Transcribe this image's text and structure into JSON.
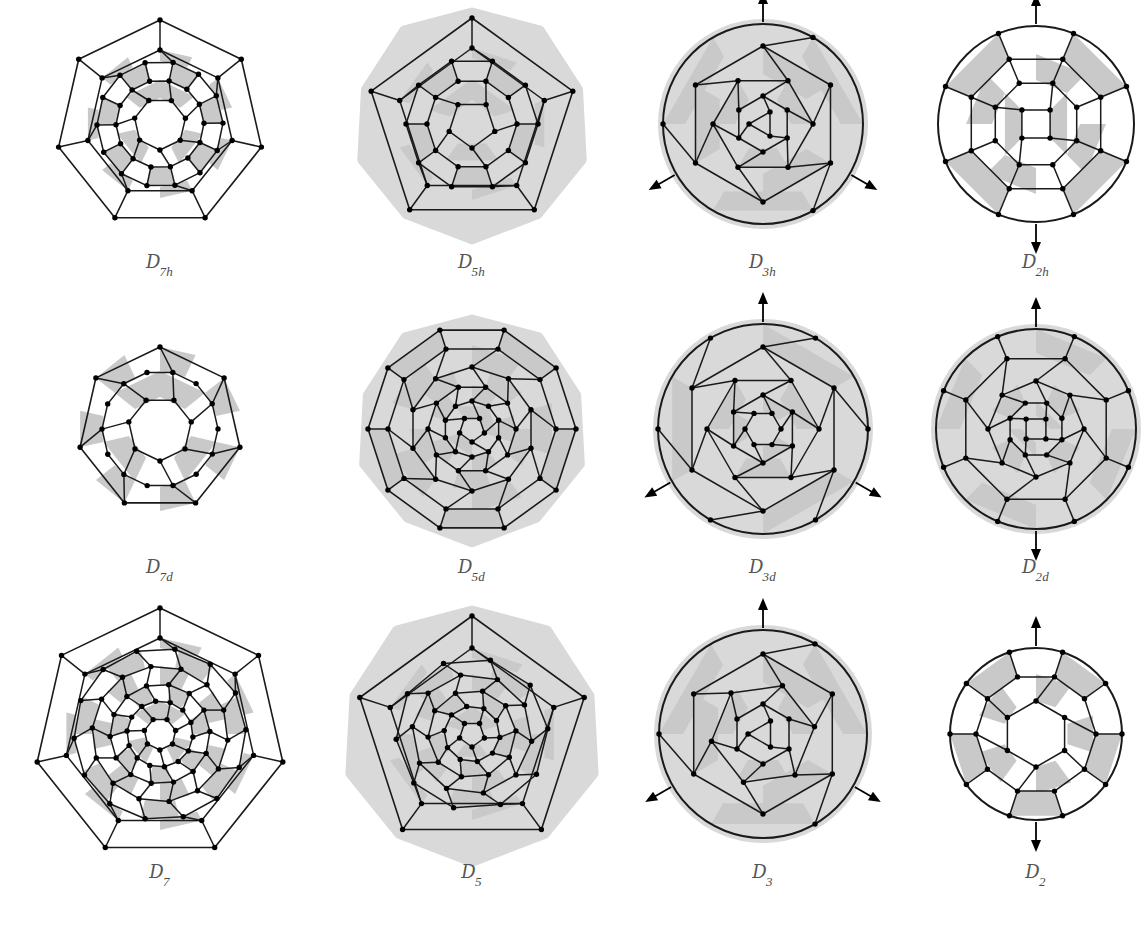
{
  "figure": {
    "kind": "fullerene-schlegel-diagram-grid",
    "rows": 3,
    "columns": 4,
    "background_color": "#ffffff",
    "face_fill_gray": "#c9c9c9",
    "face_fill_white": "#ffffff",
    "halo_color": "#d9d9d9",
    "edge_color": "#1a1a1a",
    "vertex_color": "#000000",
    "label_color": "#4a4a4a"
  },
  "caption": {
    "text": ""
  },
  "panels": [
    {
      "id": "d7h",
      "label_symbol": "D",
      "label_sub": "7h",
      "order": 7,
      "has_halo": false,
      "halo_shape": "none",
      "arrows": 0,
      "arrow_style": "none",
      "outer_polygon_sides": 7,
      "radius": 104,
      "rings": [
        {
          "n": 7,
          "r": 104,
          "shape": "polygon",
          "spoke_to_next": true,
          "rotate": 0
        },
        {
          "n": 7,
          "r": 74,
          "shape": "polygon",
          "spoke_to_next": true,
          "rotate": 0
        },
        {
          "n": 14,
          "r": 63,
          "shape": "polygon",
          "spoke_to_next": true,
          "rotate": 12
        },
        {
          "n": 14,
          "r": 44,
          "shape": "polygon",
          "spoke_to_next": true,
          "rotate": 12
        },
        {
          "n": 7,
          "r": 26,
          "shape": "polygon",
          "spoke_to_next": true,
          "rotate": 26
        }
      ],
      "gray_bands": [
        {
          "r_outer": 74,
          "r_inner": 63,
          "segments": 14,
          "phase": 0
        },
        {
          "r_outer": 63,
          "r_inner": 44,
          "segments": 14,
          "phase": 0.5
        },
        {
          "r_outer": 44,
          "r_inner": 26,
          "segments": 7,
          "phase": 0
        }
      ]
    },
    {
      "id": "d5h",
      "label_symbol": "D",
      "label_sub": "5h",
      "order": 5,
      "has_halo": true,
      "halo_shape": "round-pentagon",
      "arrows": 0,
      "arrow_style": "none",
      "outer_polygon_sides": 5,
      "radius": 106,
      "rings": [
        {
          "n": 5,
          "r": 106,
          "shape": "polygon",
          "spoke_to_next": true,
          "rotate": 0
        },
        {
          "n": 5,
          "r": 76,
          "shape": "polygon",
          "spoke_to_next": true,
          "rotate": 0
        },
        {
          "n": 10,
          "r": 66,
          "shape": "polygon",
          "spoke_to_next": true,
          "rotate": 18
        },
        {
          "n": 10,
          "r": 45,
          "shape": "polygon",
          "spoke_to_next": true,
          "rotate": 18
        },
        {
          "n": 5,
          "r": 24,
          "shape": "polygon",
          "spoke_to_next": true,
          "rotate": 36
        }
      ],
      "gray_bands": [
        {
          "r_outer": 76,
          "r_inner": 66,
          "segments": 10,
          "phase": 0
        },
        {
          "r_outer": 66,
          "r_inner": 45,
          "segments": 10,
          "phase": 0.5
        },
        {
          "r_outer": 45,
          "r_inner": 24,
          "segments": 5,
          "phase": 0
        }
      ]
    },
    {
      "id": "d3h",
      "label_symbol": "D",
      "label_sub": "3h",
      "order": 3,
      "has_halo": true,
      "halo_shape": "circle",
      "arrows": 3,
      "arrow_style": "c2-axes",
      "arrow_phase": 90,
      "outer_polygon_sides": 3,
      "radius": 100,
      "rings": [
        {
          "n": 3,
          "r": 100,
          "shape": "circle",
          "spoke_to_next": true,
          "rotate": 30
        },
        {
          "n": 6,
          "r": 78,
          "shape": "polygon",
          "spoke_to_next": true,
          "rotate": 0
        },
        {
          "n": 6,
          "r": 50,
          "shape": "polygon",
          "spoke_to_next": true,
          "rotate": 30
        },
        {
          "n": 6,
          "r": 28,
          "shape": "polygon",
          "spoke_to_next": true,
          "rotate": 0
        },
        {
          "n": 3,
          "r": 14,
          "shape": "polygon",
          "spoke_to_next": false,
          "rotate": 30
        }
      ],
      "gray_bands": [
        {
          "r_outer": 100,
          "r_inner": 78,
          "segments": 6,
          "phase": 0.5
        },
        {
          "r_outer": 78,
          "r_inner": 50,
          "segments": 6,
          "phase": 0
        },
        {
          "r_outer": 50,
          "r_inner": 28,
          "segments": 6,
          "phase": 0.5
        }
      ]
    },
    {
      "id": "d2h",
      "label_symbol": "D",
      "label_sub": "2h",
      "order": 2,
      "has_halo": false,
      "halo_shape": "none",
      "arrows": 2,
      "arrow_style": "c2-vertical",
      "arrow_phase": 90,
      "outer_polygon_sides": 2,
      "radius": 98,
      "rings": [
        {
          "n": 8,
          "r": 98,
          "shape": "circle",
          "spoke_to_next": true,
          "rotate": 22.5
        },
        {
          "n": 8,
          "r": 70,
          "shape": "polygon",
          "spoke_to_next": true,
          "rotate": 22.5
        },
        {
          "n": 8,
          "r": 44,
          "shape": "polygon",
          "spoke_to_next": true,
          "rotate": 22.5
        },
        {
          "n": 4,
          "r": 20,
          "shape": "polygon",
          "spoke_to_next": false,
          "rotate": 45
        }
      ],
      "gray_bands": [
        {
          "r_outer": 98,
          "r_inner": 70,
          "segments": 8,
          "phase": 0.5
        },
        {
          "r_outer": 70,
          "r_inner": 44,
          "segments": 8,
          "phase": 0
        },
        {
          "r_outer": 44,
          "r_inner": 20,
          "segments": 4,
          "phase": 0.5
        }
      ]
    },
    {
      "id": "d7d",
      "label_symbol": "D",
      "label_sub": "7d",
      "order": 7,
      "has_halo": false,
      "halo_shape": "none",
      "arrows": 0,
      "arrow_style": "none",
      "outer_polygon_sides": 7,
      "radius": 82,
      "rings": [
        {
          "n": 7,
          "r": 82,
          "shape": "polygon",
          "spoke_to_next": true,
          "rotate": 0
        },
        {
          "n": 14,
          "r": 58,
          "shape": "polygon",
          "spoke_to_next": true,
          "rotate": 12.8
        },
        {
          "n": 7,
          "r": 32,
          "shape": "polygon",
          "spoke_to_next": true,
          "rotate": 25.7
        }
      ],
      "gray_bands": [
        {
          "r_outer": 82,
          "r_inner": 58,
          "segments": 14,
          "phase": 0
        },
        {
          "r_outer": 58,
          "r_inner": 32,
          "segments": 7,
          "phase": 0
        }
      ]
    },
    {
      "id": "d5d",
      "label_symbol": "D",
      "label_sub": "5d",
      "order": 5,
      "has_halo": true,
      "halo_shape": "round-pentagon",
      "arrows": 0,
      "arrow_style": "none",
      "outer_polygon_sides": 10,
      "radius": 104,
      "rings": [
        {
          "n": 10,
          "r": 104,
          "shape": "polygon",
          "spoke_to_next": true,
          "rotate": 18
        },
        {
          "n": 10,
          "r": 84,
          "shape": "polygon",
          "spoke_to_next": true,
          "rotate": 18
        },
        {
          "n": 10,
          "r": 62,
          "shape": "polygon",
          "spoke_to_next": true,
          "rotate": 0
        },
        {
          "n": 10,
          "r": 44,
          "shape": "polygon",
          "spoke_to_next": true,
          "rotate": 18
        },
        {
          "n": 10,
          "r": 28,
          "shape": "polygon",
          "spoke_to_next": true,
          "rotate": 0
        },
        {
          "n": 5,
          "r": 13,
          "shape": "polygon",
          "spoke_to_next": false,
          "rotate": 36
        }
      ],
      "gray_bands": [
        {
          "r_outer": 104,
          "r_inner": 84,
          "segments": 10,
          "phase": 0.5
        },
        {
          "r_outer": 84,
          "r_inner": 62,
          "segments": 10,
          "phase": 0
        },
        {
          "r_outer": 62,
          "r_inner": 44,
          "segments": 10,
          "phase": 0.5
        },
        {
          "r_outer": 44,
          "r_inner": 28,
          "segments": 10,
          "phase": 0
        },
        {
          "r_outer": 28,
          "r_inner": 13,
          "segments": 5,
          "phase": 0.5
        }
      ]
    },
    {
      "id": "d3d",
      "label_symbol": "D",
      "label_sub": "3d",
      "order": 3,
      "has_halo": true,
      "halo_shape": "circle",
      "arrows": 3,
      "arrow_style": "c2-axes",
      "arrow_phase": 90,
      "outer_polygon_sides": 6,
      "radius": 105,
      "rings": [
        {
          "n": 6,
          "r": 105,
          "shape": "circle",
          "spoke_to_next": true,
          "rotate": 30
        },
        {
          "n": 6,
          "r": 82,
          "shape": "polygon",
          "spoke_to_next": true,
          "rotate": 0
        },
        {
          "n": 6,
          "r": 56,
          "shape": "polygon",
          "spoke_to_next": true,
          "rotate": 30
        },
        {
          "n": 6,
          "r": 34,
          "shape": "polygon",
          "spoke_to_next": true,
          "rotate": 0
        },
        {
          "n": 6,
          "r": 18,
          "shape": "polygon",
          "spoke_to_next": false,
          "rotate": 30
        }
      ],
      "gray_bands": [
        {
          "r_outer": 105,
          "r_inner": 82,
          "segments": 6,
          "phase": 0
        },
        {
          "r_outer": 56,
          "r_inner": 34,
          "segments": 6,
          "phase": 0.5
        },
        {
          "r_outer": 34,
          "r_inner": 18,
          "segments": 6,
          "phase": 0
        }
      ]
    },
    {
      "id": "d2d",
      "label_symbol": "D",
      "label_sub": "2d",
      "order": 2,
      "has_halo": true,
      "halo_shape": "circle",
      "arrows": 2,
      "arrow_style": "c2-vertical",
      "arrow_phase": 90,
      "outer_polygon_sides": 4,
      "radius": 100,
      "rings": [
        {
          "n": 8,
          "r": 100,
          "shape": "circle",
          "spoke_to_next": true,
          "rotate": 22.5
        },
        {
          "n": 8,
          "r": 76,
          "shape": "polygon",
          "spoke_to_next": true,
          "rotate": 22.5
        },
        {
          "n": 8,
          "r": 48,
          "shape": "polygon",
          "spoke_to_next": true,
          "rotate": 0
        },
        {
          "n": 8,
          "r": 28,
          "shape": "polygon",
          "spoke_to_next": true,
          "rotate": 22.5
        },
        {
          "n": 4,
          "r": 14,
          "shape": "polygon",
          "spoke_to_next": false,
          "rotate": 45
        }
      ],
      "gray_bands": [
        {
          "r_outer": 100,
          "r_inner": 76,
          "segments": 8,
          "phase": 0
        },
        {
          "r_outer": 48,
          "r_inner": 28,
          "segments": 8,
          "phase": 0.5
        },
        {
          "r_outer": 28,
          "r_inner": 14,
          "segments": 4,
          "phase": 0
        }
      ]
    },
    {
      "id": "d7",
      "label_symbol": "D",
      "label_sub": "7",
      "order": 7,
      "has_halo": false,
      "halo_shape": "none",
      "arrows": 0,
      "arrow_style": "none",
      "outer_polygon_sides": 7,
      "radius": 126,
      "rings": [
        {
          "n": 7,
          "r": 126,
          "shape": "polygon",
          "spoke_to_next": true,
          "rotate": 0
        },
        {
          "n": 7,
          "r": 96,
          "shape": "polygon",
          "spoke_to_next": true,
          "rotate": 0
        },
        {
          "n": 14,
          "r": 86,
          "shape": "polygon",
          "spoke_to_next": true,
          "rotate": 10
        },
        {
          "n": 14,
          "r": 68,
          "shape": "polygon",
          "spoke_to_next": true,
          "rotate": 18
        },
        {
          "n": 14,
          "r": 50,
          "shape": "polygon",
          "spoke_to_next": true,
          "rotate": 10
        },
        {
          "n": 14,
          "r": 33,
          "shape": "polygon",
          "spoke_to_next": true,
          "rotate": 18
        },
        {
          "n": 7,
          "r": 16,
          "shape": "polygon",
          "spoke_to_next": false,
          "rotate": 26
        }
      ],
      "gray_bands": [
        {
          "r_outer": 96,
          "r_inner": 86,
          "segments": 14,
          "phase": 0
        },
        {
          "r_outer": 86,
          "r_inner": 68,
          "segments": 14,
          "phase": 0.5
        },
        {
          "r_outer": 68,
          "r_inner": 50,
          "segments": 14,
          "phase": 0
        },
        {
          "r_outer": 50,
          "r_inner": 33,
          "segments": 14,
          "phase": 0.5
        },
        {
          "r_outer": 33,
          "r_inner": 16,
          "segments": 7,
          "phase": 0
        }
      ]
    },
    {
      "id": "d5",
      "label_symbol": "D",
      "label_sub": "5",
      "order": 5,
      "has_halo": true,
      "halo_shape": "round-pentagon",
      "arrows": 0,
      "arrow_style": "none",
      "outer_polygon_sides": 5,
      "radius": 118,
      "rings": [
        {
          "n": 5,
          "r": 118,
          "shape": "polygon",
          "spoke_to_next": true,
          "rotate": 0
        },
        {
          "n": 5,
          "r": 86,
          "shape": "polygon",
          "spoke_to_next": true,
          "rotate": 0
        },
        {
          "n": 10,
          "r": 76,
          "shape": "polygon",
          "spoke_to_next": true,
          "rotate": 14
        },
        {
          "n": 10,
          "r": 60,
          "shape": "polygon",
          "spoke_to_next": true,
          "rotate": 25
        },
        {
          "n": 10,
          "r": 44,
          "shape": "polygon",
          "spoke_to_next": true,
          "rotate": 14
        },
        {
          "n": 10,
          "r": 28,
          "shape": "polygon",
          "spoke_to_next": true,
          "rotate": 25
        },
        {
          "n": 5,
          "r": 13,
          "shape": "polygon",
          "spoke_to_next": false,
          "rotate": 36
        }
      ],
      "gray_bands": [
        {
          "r_outer": 86,
          "r_inner": 76,
          "segments": 10,
          "phase": 0
        },
        {
          "r_outer": 76,
          "r_inner": 60,
          "segments": 10,
          "phase": 0.5
        },
        {
          "r_outer": 60,
          "r_inner": 44,
          "segments": 10,
          "phase": 0
        },
        {
          "r_outer": 44,
          "r_inner": 28,
          "segments": 10,
          "phase": 0.5
        },
        {
          "r_outer": 28,
          "r_inner": 13,
          "segments": 5,
          "phase": 0
        }
      ]
    },
    {
      "id": "d3",
      "label_symbol": "D",
      "label_sub": "3",
      "order": 3,
      "has_halo": true,
      "halo_shape": "circle",
      "arrows": 3,
      "arrow_style": "c2-axes",
      "arrow_phase": 90,
      "outer_polygon_sides": 3,
      "radius": 104,
      "rings": [
        {
          "n": 3,
          "r": 104,
          "shape": "circle",
          "spoke_to_next": true,
          "rotate": 30
        },
        {
          "n": 6,
          "r": 80,
          "shape": "polygon",
          "spoke_to_next": true,
          "rotate": 0
        },
        {
          "n": 6,
          "r": 52,
          "shape": "polygon",
          "spoke_to_next": true,
          "rotate": 22
        },
        {
          "n": 6,
          "r": 30,
          "shape": "polygon",
          "spoke_to_next": true,
          "rotate": 0
        },
        {
          "n": 3,
          "r": 15,
          "shape": "polygon",
          "spoke_to_next": false,
          "rotate": 30
        }
      ],
      "gray_bands": [
        {
          "r_outer": 104,
          "r_inner": 80,
          "segments": 6,
          "phase": 0.5
        },
        {
          "r_outer": 80,
          "r_inner": 52,
          "segments": 6,
          "phase": 0
        },
        {
          "r_outer": 52,
          "r_inner": 30,
          "segments": 6,
          "phase": 0.5
        }
      ]
    },
    {
      "id": "d2",
      "label_symbol": "D",
      "label_sub": "2",
      "order": 2,
      "has_halo": false,
      "halo_shape": "none",
      "arrows": 2,
      "arrow_style": "c2-vertical",
      "arrow_phase": 90,
      "outer_polygon_sides": 2,
      "radius": 86,
      "rings": [
        {
          "n": 10,
          "r": 86,
          "shape": "circle",
          "spoke_to_next": true,
          "rotate": 18
        },
        {
          "n": 10,
          "r": 60,
          "shape": "polygon",
          "spoke_to_next": true,
          "rotate": 18
        },
        {
          "n": 6,
          "r": 33,
          "shape": "polygon",
          "spoke_to_next": false,
          "rotate": 0
        }
      ],
      "gray_bands": [
        {
          "r_outer": 86,
          "r_inner": 60,
          "segments": 10,
          "phase": 0.5
        },
        {
          "r_outer": 60,
          "r_inner": 33,
          "segments": 10,
          "phase": 0
        }
      ]
    }
  ]
}
